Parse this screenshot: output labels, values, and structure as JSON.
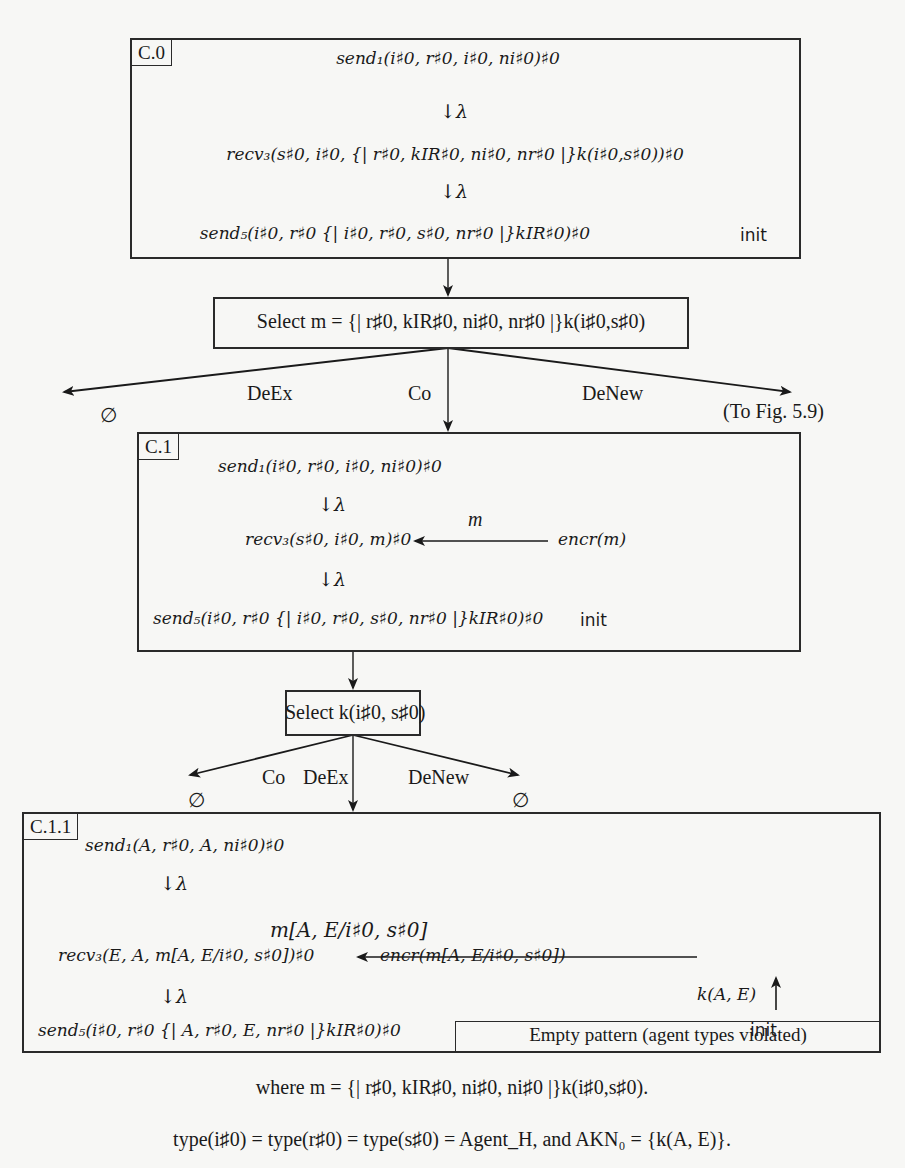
{
  "figure": {
    "c0": {
      "label": "C.0",
      "step1": "send₁(i♯0, r♯0,  i♯0, ni♯0)♯0",
      "lambda1": "↓λ",
      "step2": "recv₃(s♯0, i♯0,  {| r♯0, kIR♯0, ni♯0, nr♯0 |}k(i♯0,s♯0))♯0",
      "lambda2": "↓λ",
      "step3": "send₅(i♯0, r♯0 {| i♯0, r♯0, s♯0, nr♯0 |}kIR♯0)♯0",
      "init": "init"
    },
    "select_m": {
      "text": "Select m = {| r♯0, kIR♯0, ni♯0, nr♯0 |}k(i♯0,s♯0)"
    },
    "branch1": {
      "left_label": "DeEx",
      "left_result": "∅",
      "center_label": "Co",
      "right_label": "DeNew",
      "right_result": "(To Fig. 5.9)"
    },
    "c1": {
      "label": "C.1",
      "step1": "send₁(i♯0, r♯0,  i♯0, ni♯0)♯0",
      "lambda1": "↓λ",
      "step2": "recv₃(s♯0, i♯0,  m)♯0",
      "edge_label": "m",
      "source": "encr(m)",
      "lambda2": "↓λ",
      "step3": "send₅(i♯0, r♯0 {| i♯0, r♯0, s♯0, nr♯0 |}kIR♯0)♯0",
      "init": "init"
    },
    "select_k": {
      "text": "Select k(i♯0, s♯0)"
    },
    "branch2": {
      "left_label": "Co",
      "left_result": "∅",
      "center_label": "DeEx",
      "right_label": "DeNew",
      "right_result": "∅"
    },
    "c11": {
      "label": "C.1.1",
      "step1": "send₁(A, r♯0,  A, ni♯0)♯0",
      "lambda1": "↓λ",
      "step2": "recv₃(E, A,  m[A, E/i♯0, s♯0])♯0",
      "edge_label": "m[A, E/i♯0, s♯0]",
      "source": "encr(m[A, E/i♯0, s♯0])",
      "key_label": "k(A, E)",
      "lambda2": "↓λ",
      "step3": "send₅(i♯0, r♯0 {| A, r♯0, E, nr♯0 |}kIR♯0)♯0",
      "init": "init",
      "result": "Empty pattern (agent types violated)"
    },
    "caption": {
      "where": "where m = {| r♯0, kIR♯0, ni♯0, ni♯0 |}k(i♯0,s♯0).",
      "types": "type(i♯0) = type(r♯0) = type(s♯0) = Agent_H, and AKN₀ = {k(A, E)}."
    }
  }
}
